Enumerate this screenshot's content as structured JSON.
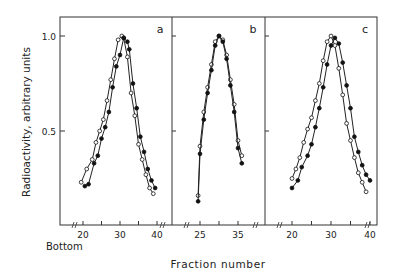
{
  "chart_data": {
    "type": "line",
    "ylabel": "Radioactivity, arbitrary units",
    "xlabel": "Fraction number",
    "x_annotation": "Bottom",
    "y_ticks": [
      0.5,
      1.0
    ],
    "y_tick_labels": [
      "0.5",
      "1.0"
    ],
    "ylim": [
      0,
      1.05
    ],
    "legend": {
      "open_circle": "series 1",
      "filled_circle": "series 2"
    },
    "panels": [
      {
        "label": "a",
        "xlim": [
          18,
          42
        ],
        "x_ticks": [
          20,
          25,
          30,
          35,
          40
        ],
        "x_tick_labels": [
          "20",
          "30",
          "40"
        ],
        "series": [
          {
            "name": "open",
            "marker": "open-circle",
            "x": [
              19.5,
              21,
              22.5,
              23.5,
              24.5,
              25.5,
              26.5,
              27.5,
              28.5,
              29.5,
              30.5,
              31,
              32,
              33,
              34,
              35,
              36,
              37,
              38,
              39
            ],
            "y": [
              0.23,
              0.3,
              0.35,
              0.44,
              0.5,
              0.56,
              0.66,
              0.77,
              0.88,
              0.98,
              1.0,
              0.99,
              0.89,
              0.7,
              0.58,
              0.43,
              0.35,
              0.27,
              0.2,
              0.17
            ]
          },
          {
            "name": "filled",
            "marker": "filled-circle",
            "x": [
              20.5,
              21.5,
              23,
              24,
              25,
              26,
              27,
              28,
              29,
              30,
              31,
              32,
              32.5,
              33.5,
              34.5,
              35.5,
              36.5,
              37.5,
              38.5,
              39.5
            ],
            "y": [
              0.21,
              0.22,
              0.33,
              0.37,
              0.46,
              0.52,
              0.6,
              0.73,
              0.84,
              0.9,
              0.99,
              0.97,
              0.93,
              0.75,
              0.62,
              0.47,
              0.39,
              0.3,
              0.24,
              0.2
            ]
          }
        ]
      },
      {
        "label": "b",
        "xlim": [
          22,
          38
        ],
        "x_ticks": [
          25,
          30,
          35
        ],
        "x_tick_labels": [
          "25",
          "35"
        ],
        "series": [
          {
            "name": "open",
            "marker": "open-circle",
            "x": [
              24.5,
              25,
              26,
              27,
              28,
              29,
              30,
              31,
              32,
              33,
              34,
              35,
              36
            ],
            "y": [
              0.16,
              0.42,
              0.6,
              0.73,
              0.85,
              0.97,
              1.0,
              0.98,
              0.9,
              0.77,
              0.64,
              0.45,
              0.37
            ]
          },
          {
            "name": "filled",
            "marker": "filled-circle",
            "x": [
              24.5,
              25,
              26,
              27,
              28,
              29,
              30,
              31,
              32,
              33,
              34,
              35,
              36
            ],
            "y": [
              0.13,
              0.38,
              0.56,
              0.7,
              0.82,
              0.95,
              1.0,
              0.97,
              0.88,
              0.74,
              0.6,
              0.41,
              0.33
            ]
          }
        ]
      },
      {
        "label": "c",
        "xlim": [
          18,
          42
        ],
        "x_ticks": [
          20,
          25,
          30,
          35,
          40
        ],
        "x_tick_labels": [
          "20",
          "30",
          "40"
        ],
        "series": [
          {
            "name": "open",
            "marker": "open-circle",
            "x": [
              20,
              21,
              22,
              23,
              24,
              25,
              26,
              27,
              28,
              29,
              30,
              31,
              32,
              33,
              34,
              35,
              36,
              37,
              38,
              39
            ],
            "y": [
              0.25,
              0.3,
              0.36,
              0.44,
              0.51,
              0.57,
              0.66,
              0.75,
              0.87,
              0.97,
              1.0,
              0.95,
              0.83,
              0.69,
              0.54,
              0.45,
              0.36,
              0.28,
              0.23,
              0.18
            ]
          },
          {
            "name": "filled",
            "marker": "filled-circle",
            "x": [
              20,
              21.5,
              22.5,
              24,
              25,
              26,
              27,
              28,
              29,
              30,
              31,
              32,
              33,
              34,
              35,
              36,
              37,
              38,
              39,
              40
            ],
            "y": [
              0.2,
              0.24,
              0.31,
              0.37,
              0.43,
              0.52,
              0.62,
              0.73,
              0.85,
              0.95,
              0.99,
              0.96,
              0.86,
              0.74,
              0.62,
              0.47,
              0.39,
              0.32,
              0.27,
              0.24
            ]
          }
        ]
      }
    ]
  }
}
